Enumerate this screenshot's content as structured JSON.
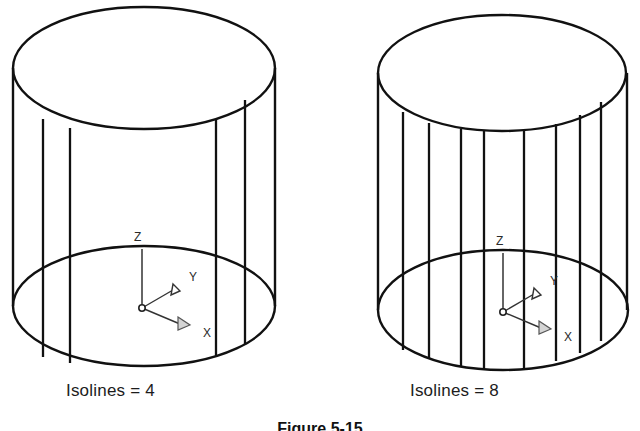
{
  "page": {
    "background_color": "#ffffff",
    "width": 640,
    "height": 431
  },
  "figure": {
    "caption": "Figure 5-15",
    "caption_clipped": true,
    "line_color": "#111111",
    "axis_label_color": "#2a2a2a",
    "x_arrow_fill": "#d4d4d4"
  },
  "panels": [
    {
      "id": "left",
      "label": "Isolines = 4",
      "isolines": 4,
      "ucs": {
        "z_label": "Z",
        "y_label": "Y",
        "x_label": "X"
      },
      "geometry": {
        "cx": 144,
        "top_cy": 68,
        "bottom_cy": 306,
        "rx": 131,
        "ry": 60,
        "isoline_x": [
          43,
          70,
          216,
          245
        ]
      }
    },
    {
      "id": "right",
      "label": "Isolines = 8",
      "isolines": 8,
      "ucs": {
        "z_label": "Z",
        "y_label": "Y",
        "x_label": "X"
      },
      "geometry": {
        "cx": 503,
        "top_cy": 73,
        "bottom_cy": 310,
        "rx": 124,
        "ry": 58,
        "isoline_x": [
          411,
          436,
          466,
          482,
          524,
          556,
          577,
          597
        ]
      }
    }
  ]
}
